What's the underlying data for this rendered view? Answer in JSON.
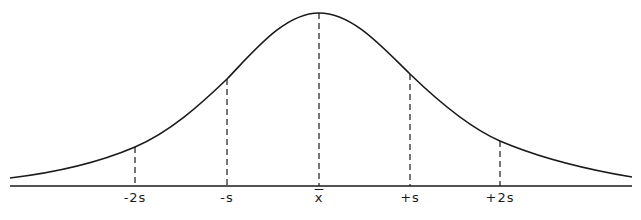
{
  "diagram": {
    "line_color": "#1a1a1a",
    "labels": [
      {
        "id": "minus-2s",
        "text": "-2s",
        "x": 135
      },
      {
        "id": "minus-s",
        "text": "-s",
        "x": 227
      },
      {
        "id": "mean",
        "text": "x",
        "x": 319
      },
      {
        "id": "plus-s",
        "text": "+s",
        "x": 410
      },
      {
        "id": "plus-2s",
        "text": "+2s",
        "x": 500
      }
    ],
    "markers": [
      {
        "x": 135,
        "y_top": 147
      },
      {
        "x": 227,
        "y_top": 79
      },
      {
        "x": 319,
        "y_top": 13
      },
      {
        "x": 410,
        "y_top": 74
      },
      {
        "x": 500,
        "y_top": 141
      }
    ],
    "baseline": {
      "y": 186,
      "x_start": 10,
      "x_end": 632
    }
  }
}
